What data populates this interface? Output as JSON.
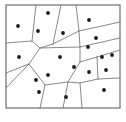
{
  "figure": {
    "type": "voronoi-diagram",
    "caption": "",
    "colors": {
      "background": "#ffffff",
      "border": "#6e6e6e",
      "cell_edge": "#7a7a7a",
      "seed_point": "#1a1a1a"
    },
    "frame": {
      "x": 6,
      "y": 5,
      "width": 114,
      "height": 103,
      "stroke_width": 1.2
    },
    "seed_point_radius": 1.9,
    "seed_point_count": 19,
    "edge_stroke_width": 0.9
  },
  "chart_data": {
    "type": "scatter",
    "xlabel": "",
    "ylabel": "",
    "xlim": [
      6,
      120
    ],
    "ylim": [
      5,
      108
    ],
    "grid": false,
    "legend": null,
    "seeds": [
      {
        "id": 1,
        "x": 48,
        "y": 13
      },
      {
        "id": 2,
        "x": 89,
        "y": 20
      },
      {
        "id": 3,
        "x": 18,
        "y": 26
      },
      {
        "id": 4,
        "x": 38,
        "y": 31
      },
      {
        "id": 5,
        "x": 63,
        "y": 33
      },
      {
        "id": 6,
        "x": 96,
        "y": 38
      },
      {
        "id": 7,
        "x": 19,
        "y": 57
      },
      {
        "id": 8,
        "x": 60,
        "y": 57
      },
      {
        "id": 9,
        "x": 102,
        "y": 57
      },
      {
        "id": 10,
        "x": 112,
        "y": 55
      },
      {
        "id": 11,
        "x": 89,
        "y": 72
      },
      {
        "id": 12,
        "x": 74,
        "y": 67
      },
      {
        "id": 13,
        "x": 106,
        "y": 70
      },
      {
        "id": 14,
        "x": 48,
        "y": 75
      },
      {
        "id": 15,
        "x": 36,
        "y": 80
      },
      {
        "id": 16,
        "x": 39,
        "y": 92
      },
      {
        "id": 17,
        "x": 66,
        "y": 97
      },
      {
        "id": 18,
        "x": 104,
        "y": 90
      },
      {
        "id": 19,
        "x": 88,
        "y": 47
      }
    ],
    "edges": [
      {
        "x1": 36,
        "y1": 5,
        "x2": 32,
        "y2": 41
      },
      {
        "x1": 32,
        "y1": 41,
        "x2": 40,
        "y2": 48
      },
      {
        "x1": 40,
        "y1": 48,
        "x2": 53,
        "y2": 44
      },
      {
        "x1": 53,
        "y1": 44,
        "x2": 61,
        "y2": 5
      },
      {
        "x1": 6,
        "y1": 43,
        "x2": 32,
        "y2": 41
      },
      {
        "x1": 53,
        "y1": 44,
        "x2": 79,
        "y2": 31
      },
      {
        "x1": 79,
        "y1": 31,
        "x2": 76,
        "y2": 5
      },
      {
        "x1": 79,
        "y1": 31,
        "x2": 120,
        "y2": 22
      },
      {
        "x1": 120,
        "y1": 38,
        "x2": 80,
        "y2": 47
      },
      {
        "x1": 80,
        "y1": 47,
        "x2": 79,
        "y2": 31
      },
      {
        "x1": 80,
        "y1": 47,
        "x2": 40,
        "y2": 48
      },
      {
        "x1": 40,
        "y1": 48,
        "x2": 29,
        "y2": 64
      },
      {
        "x1": 29,
        "y1": 64,
        "x2": 6,
        "y2": 73
      },
      {
        "x1": 29,
        "y1": 64,
        "x2": 6,
        "y2": 88
      },
      {
        "x1": 29,
        "y1": 64,
        "x2": 45,
        "y2": 85
      },
      {
        "x1": 45,
        "y1": 85,
        "x2": 40,
        "y2": 108
      },
      {
        "x1": 45,
        "y1": 85,
        "x2": 68,
        "y2": 82
      },
      {
        "x1": 68,
        "y1": 82,
        "x2": 80,
        "y2": 62
      },
      {
        "x1": 80,
        "y1": 62,
        "x2": 80,
        "y2": 47
      },
      {
        "x1": 80,
        "y1": 62,
        "x2": 97,
        "y2": 57
      },
      {
        "x1": 97,
        "y1": 57,
        "x2": 120,
        "y2": 50
      },
      {
        "x1": 97,
        "y1": 57,
        "x2": 98,
        "y2": 79
      },
      {
        "x1": 98,
        "y1": 79,
        "x2": 120,
        "y2": 78
      },
      {
        "x1": 98,
        "y1": 79,
        "x2": 80,
        "y2": 83
      },
      {
        "x1": 80,
        "y1": 83,
        "x2": 68,
        "y2": 82
      },
      {
        "x1": 80,
        "y1": 83,
        "x2": 82,
        "y2": 108
      },
      {
        "x1": 68,
        "y1": 82,
        "x2": 63,
        "y2": 108
      }
    ]
  }
}
